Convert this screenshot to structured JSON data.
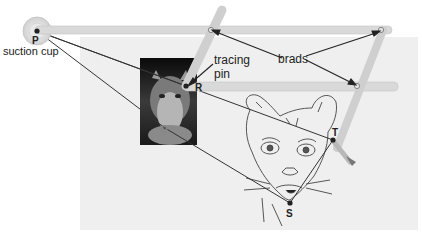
{
  "diagram": {
    "labels": {
      "suction_cup": "suction cup",
      "tracing_pin": "tracing pin",
      "brads": "brads"
    },
    "points": {
      "P": "P",
      "Q": "Q",
      "R": "R",
      "S": "S",
      "T": "T"
    },
    "colors": {
      "paper": "#efefef",
      "rod": "#d9d9d9",
      "rod_edge": "#c4c4c4",
      "line": "#333333",
      "photo_bg": "#111111",
      "text": "#222222"
    },
    "components": [
      "suction cup at P",
      "tracing pin at R",
      "brads at pantograph joints",
      "pencil at T",
      "photo of cougar (original)",
      "enlarged line drawing of cougar (copy)"
    ]
  }
}
